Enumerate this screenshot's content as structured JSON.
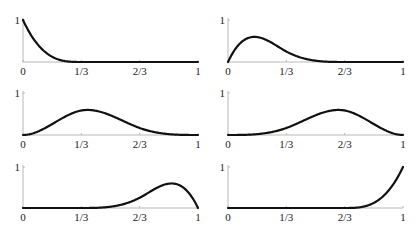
{
  "chart_data": {
    "type": "line",
    "title": "",
    "knots": [
      0,
      0,
      0,
      0,
      0.3333,
      0.6667,
      1,
      1,
      1,
      1
    ],
    "degree": 3,
    "xlim": [
      0,
      1
    ],
    "ylim": [
      0,
      1
    ],
    "x_tick_labels": [
      "0",
      "1/3",
      "2/3",
      "1"
    ],
    "x_ticks": [
      0,
      0.3333,
      0.6667,
      1
    ],
    "y_tick_labels": [
      "1"
    ],
    "y_ticks": [
      1
    ],
    "grid": false,
    "legend": null,
    "layout": {
      "rows": 3,
      "cols": 2
    },
    "series": [
      {
        "name": "N0",
        "panel": [
          0,
          0
        ],
        "x": [
          0,
          0.05,
          0.1,
          0.15,
          0.2,
          0.25,
          0.3,
          0.3333,
          0.5,
          0.6667,
          1
        ],
        "values": [
          1.0,
          0.579,
          0.296,
          0.125,
          0.037,
          0.005,
          0.0,
          0.0,
          0.0,
          0.0,
          0.0
        ]
      },
      {
        "name": "N1",
        "panel": [
          0,
          1
        ],
        "x": [
          0,
          0.05,
          0.1,
          0.15,
          0.2,
          0.25,
          0.3333,
          0.4,
          0.5,
          0.6,
          0.6667,
          1
        ],
        "values": [
          0.0,
          0.366,
          0.539,
          0.576,
          0.53,
          0.445,
          0.25,
          0.144,
          0.042,
          0.004,
          0.0,
          0.0
        ]
      },
      {
        "name": "N2",
        "panel": [
          1,
          0
        ],
        "x": [
          0,
          0.1,
          0.2,
          0.3,
          0.3333,
          0.4,
          0.5,
          0.6,
          0.6667,
          0.8,
          1
        ],
        "values": [
          0.0,
          0.158,
          0.44,
          0.61,
          0.583,
          0.642,
          0.542,
          0.36,
          0.25,
          0.063,
          0.0
        ]
      },
      {
        "name": "N3",
        "panel": [
          1,
          1
        ],
        "x": [
          0,
          0.2,
          0.3333,
          0.4,
          0.5,
          0.6,
          0.6667,
          0.7,
          0.8,
          0.9,
          1
        ],
        "values": [
          0.0,
          0.063,
          0.25,
          0.36,
          0.542,
          0.642,
          0.583,
          0.61,
          0.44,
          0.158,
          0.0
        ]
      },
      {
        "name": "N4",
        "panel": [
          2,
          0
        ],
        "x": [
          0,
          0.3333,
          0.4,
          0.5,
          0.6,
          0.6667,
          0.75,
          0.8,
          0.85,
          0.9,
          0.95,
          1
        ],
        "values": [
          0.0,
          0.0,
          0.004,
          0.042,
          0.144,
          0.25,
          0.445,
          0.53,
          0.576,
          0.539,
          0.366,
          0.0
        ]
      },
      {
        "name": "N5",
        "panel": [
          2,
          1
        ],
        "x": [
          0,
          0.3333,
          0.6667,
          0.7,
          0.75,
          0.8,
          0.85,
          0.9,
          0.95,
          1
        ],
        "values": [
          0.0,
          0.0,
          0.0,
          0.0,
          0.005,
          0.037,
          0.125,
          0.296,
          0.579,
          1.0
        ]
      }
    ]
  },
  "panels": [
    {
      "id": "N0",
      "x0": 23,
      "baseline": 62,
      "top": 20
    },
    {
      "id": "N1",
      "x0": 228,
      "baseline": 62,
      "top": 20
    },
    {
      "id": "N2",
      "x0": 23,
      "baseline": 135,
      "top": 93
    },
    {
      "id": "N3",
      "x0": 228,
      "baseline": 135,
      "top": 93
    },
    {
      "id": "N4",
      "x0": 23,
      "baseline": 208,
      "top": 167
    },
    {
      "id": "N5",
      "x0": 228,
      "baseline": 208,
      "top": 167
    }
  ],
  "panel_width": 175,
  "colors": {
    "curve": "#111111",
    "axis": "#b8b8b8",
    "text": "#222222"
  }
}
